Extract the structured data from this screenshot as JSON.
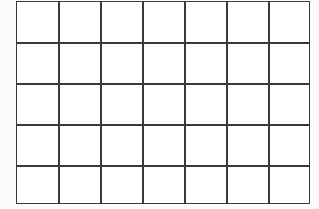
{
  "grid": {
    "columns": 7,
    "rows": 5,
    "line_color": "#3a3a3a",
    "background": "#ffffff",
    "vertical_line_x": [
      42,
      84,
      126,
      168,
      210,
      252
    ],
    "horizontal_line_y": [
      41,
      82,
      123,
      164
    ]
  }
}
